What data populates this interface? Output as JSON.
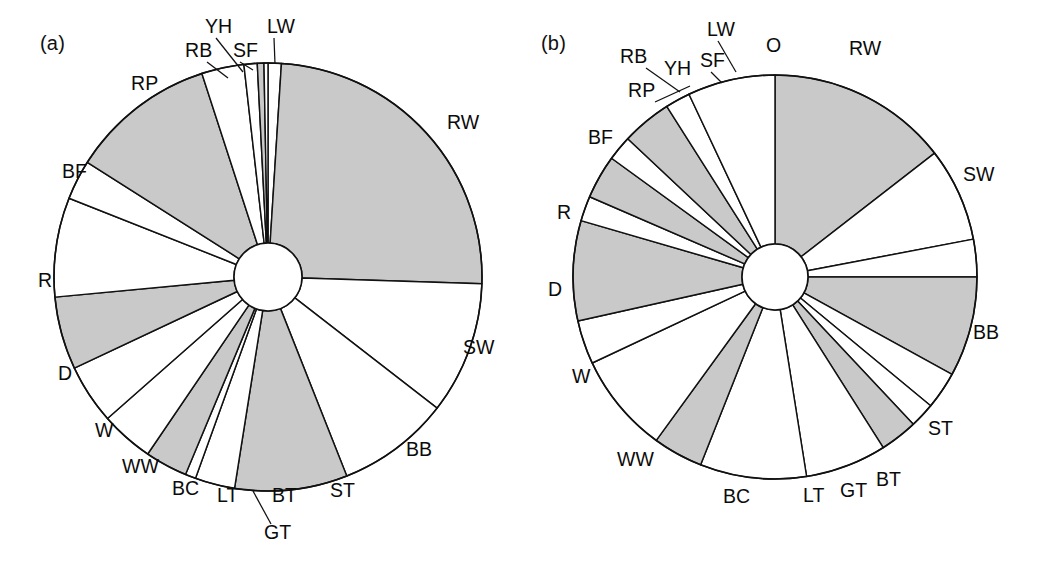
{
  "figure": {
    "background": "#ffffff",
    "line_color": "#111111",
    "shaded_fill": "#c9c9c9",
    "unshaded_fill": "#ffffff"
  },
  "panels": [
    {
      "id": "a",
      "tag": "(a)"
    },
    {
      "id": "b",
      "tag": "(b)"
    }
  ],
  "chart_data": [
    {
      "type": "pie",
      "title": "(a)",
      "panel": "a",
      "donut": true,
      "start_angle_deg": 0,
      "direction": "clockwise",
      "units": "percent",
      "note": "Sector order listed clockwise starting at 12 o'clock. 'shaded' sectors are filled grey, 'unshaded' are white.",
      "categories": [
        "LW",
        "RW",
        "SW",
        "BB",
        "ST",
        "BT",
        "GT",
        "LT",
        "BC",
        "WW",
        "W",
        "D",
        "R",
        "BF",
        "RP",
        "RB",
        "YH",
        "SF"
      ],
      "values": [
        1.0,
        24.5,
        10.0,
        8.5,
        8.5,
        3.0,
        0.8,
        3.2,
        4.0,
        4.5,
        5.5,
        7.5,
        3.0,
        11.0,
        3.2,
        1.0,
        0.5,
        0.3
      ],
      "shading": [
        "unshaded",
        "shaded",
        "unshaded",
        "unshaded",
        "shaded",
        "unshaded",
        "unshaded",
        "shaded",
        "unshaded",
        "unshaded",
        "shaded",
        "unshaded",
        "unshaded",
        "shaded",
        "unshaded",
        "unshaded",
        "shaded",
        "unshaded"
      ],
      "labels": [
        "LW",
        "RW",
        "SW",
        "BB",
        "ST",
        "BT",
        "GT",
        "LT",
        "BC",
        "WW",
        "W",
        "D",
        "R",
        "BF",
        "RP",
        "RB",
        "YH",
        "SF"
      ],
      "legend": "none",
      "grid": false
    },
    {
      "type": "pie",
      "title": "(b)",
      "panel": "b",
      "donut": true,
      "start_angle_deg": 0,
      "direction": "clockwise",
      "units": "percent",
      "note": "Sector order listed clockwise starting at 12 o'clock. 'shaded' sectors are filled grey, 'unshaded' are white.",
      "categories": [
        "RW",
        "SW",
        "BB",
        "ST",
        "BT",
        "GT",
        "LT",
        "BC",
        "WW",
        "W",
        "D",
        "R",
        "BF",
        "RP",
        "RB",
        "YH",
        "SF",
        "LW",
        "O"
      ],
      "values": [
        14.5,
        7.5,
        3.0,
        8.0,
        3.0,
        2.0,
        3.0,
        6.5,
        8.5,
        4.0,
        8.0,
        3.5,
        8.0,
        2.0,
        3.5,
        2.0,
        4.0,
        2.0,
        7.0
      ],
      "shading": [
        "shaded",
        "unshaded",
        "unshaded",
        "shaded",
        "unshaded",
        "unshaded",
        "shaded",
        "unshaded",
        "unshaded",
        "shaded",
        "unshaded",
        "unshaded",
        "shaded",
        "unshaded",
        "shaded",
        "unshaded",
        "shaded",
        "unshaded",
        "unshaded"
      ],
      "labels": [
        "RW",
        "SW",
        "BB",
        "ST",
        "BT",
        "GT",
        "LT",
        "BC",
        "WW",
        "W",
        "D",
        "R",
        "BF",
        "RP",
        "RB",
        "YH",
        "SF",
        "LW",
        "O"
      ],
      "legend": "none",
      "grid": false
    }
  ],
  "labels_a": [
    {
      "text": "YH",
      "x": 205,
      "y": 28
    },
    {
      "text": "LW",
      "x": 267,
      "y": 28
    },
    {
      "text": "RB",
      "x": 185,
      "y": 52
    },
    {
      "text": "SF",
      "x": 233,
      "y": 52
    },
    {
      "text": "RP",
      "x": 131,
      "y": 85
    },
    {
      "text": "BF",
      "x": 62,
      "y": 173
    },
    {
      "text": "R",
      "x": 38,
      "y": 282
    },
    {
      "text": "D",
      "x": 58,
      "y": 375
    },
    {
      "text": "W",
      "x": 95,
      "y": 432
    },
    {
      "text": "WW",
      "x": 122,
      "y": 468
    },
    {
      "text": "BC",
      "x": 172,
      "y": 490
    },
    {
      "text": "LT",
      "x": 217,
      "y": 497
    },
    {
      "text": "GT",
      "x": 264,
      "y": 534
    },
    {
      "text": "BT",
      "x": 272,
      "y": 497
    },
    {
      "text": "ST",
      "x": 330,
      "y": 492
    },
    {
      "text": "BB",
      "x": 406,
      "y": 451
    },
    {
      "text": "SW",
      "x": 463,
      "y": 349
    },
    {
      "text": "RW",
      "x": 447,
      "y": 124
    }
  ],
  "labels_b": [
    {
      "text": "LW",
      "x": 707,
      "y": 31
    },
    {
      "text": "O",
      "x": 766,
      "y": 47
    },
    {
      "text": "RW",
      "x": 849,
      "y": 50
    },
    {
      "text": "RB",
      "x": 620,
      "y": 58
    },
    {
      "text": "YH",
      "x": 664,
      "y": 70
    },
    {
      "text": "SF",
      "x": 700,
      "y": 62
    },
    {
      "text": "RP",
      "x": 628,
      "y": 92
    },
    {
      "text": "BF",
      "x": 588,
      "y": 139
    },
    {
      "text": "R",
      "x": 557,
      "y": 214
    },
    {
      "text": "D",
      "x": 548,
      "y": 291
    },
    {
      "text": "W",
      "x": 572,
      "y": 378
    },
    {
      "text": "WW",
      "x": 617,
      "y": 461
    },
    {
      "text": "BC",
      "x": 723,
      "y": 498
    },
    {
      "text": "LT",
      "x": 803,
      "y": 497
    },
    {
      "text": "GT",
      "x": 840,
      "y": 492
    },
    {
      "text": "BT",
      "x": 876,
      "y": 481
    },
    {
      "text": "ST",
      "x": 928,
      "y": 430
    },
    {
      "text": "BB",
      "x": 973,
      "y": 334
    },
    {
      "text": "SW",
      "x": 963,
      "y": 176
    }
  ],
  "leaders_a": [
    {
      "x1": 216,
      "y1": 38,
      "x2": 243,
      "y2": 72
    },
    {
      "x1": 240,
      "y1": 62,
      "x2": 253,
      "y2": 70
    },
    {
      "x1": 207,
      "y1": 62,
      "x2": 228,
      "y2": 78
    },
    {
      "x1": 274,
      "y1": 38,
      "x2": 275,
      "y2": 64
    },
    {
      "x1": 271,
      "y1": 524,
      "x2": 253,
      "y2": 491
    }
  ],
  "leaders_b": [
    {
      "x1": 718,
      "y1": 41,
      "x2": 736,
      "y2": 72
    },
    {
      "x1": 646,
      "y1": 68,
      "x2": 680,
      "y2": 92
    },
    {
      "x1": 711,
      "y1": 72,
      "x2": 722,
      "y2": 83
    },
    {
      "x1": 655,
      "y1": 102,
      "x2": 690,
      "y2": 86
    }
  ]
}
